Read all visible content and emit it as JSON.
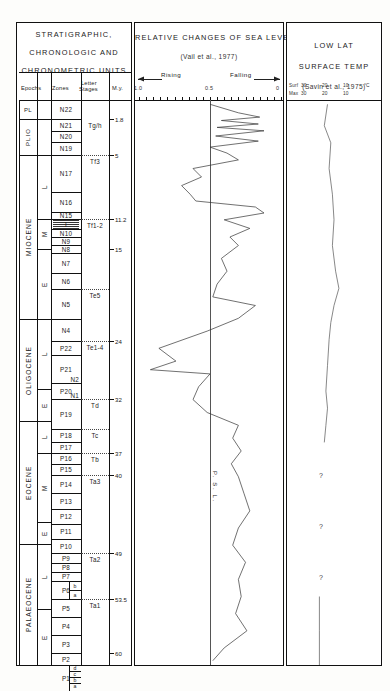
{
  "panels": {
    "strat": {
      "title_lines": [
        "STRATIGRAPHIC,",
        "CHRONOLOGIC  AND",
        "CHRONOMETRIC   UNITS"
      ],
      "column_headers": [
        "Epochs",
        "Zones",
        "Letter",
        "Stages",
        "M.y."
      ]
    },
    "sea": {
      "title": "RELATIVE CHANGES OF SEA LEVEL",
      "source": "(Vail et al., 1977)",
      "rising_label": "Rising",
      "falling_label": "Falling",
      "scale_ticks": [
        "1.0",
        "0.5",
        "0"
      ],
      "curve_label": "P. S. L."
    },
    "temp": {
      "title_lines": [
        "LOW  LAT",
        "SURFACE  TEMP"
      ],
      "source": "(Savin et al., 1975)",
      "scale_rows": [
        {
          "name": "Surf",
          "ticks": [
            "30",
            "20",
            "10",
            "°C"
          ]
        },
        {
          "name": "Max",
          "ticks": [
            "30",
            "20",
            "10"
          ]
        }
      ],
      "uncertain_marks": [
        "?",
        "?",
        "?"
      ]
    }
  },
  "epochs": [
    {
      "label": "PL",
      "top": 99,
      "bottom": 118
    },
    {
      "label": "PLIO",
      "top": 118,
      "bottom": 154
    },
    {
      "label": "MIOCENE",
      "top": 154,
      "bottom": 318
    },
    {
      "label": "OLIGOCENE",
      "top": 318,
      "bottom": 420
    },
    {
      "label": "EOCENE",
      "top": 420,
      "bottom": 543
    },
    {
      "label": "PALAEOCENE",
      "top": 543,
      "bottom": 664
    }
  ],
  "subepochs": [
    {
      "label": "L",
      "top": 154,
      "bottom": 218
    },
    {
      "label": "M",
      "top": 218,
      "bottom": 248
    },
    {
      "label": "E",
      "top": 248,
      "bottom": 318
    },
    {
      "label": "L",
      "top": 318,
      "bottom": 388
    },
    {
      "label": "E",
      "top": 388,
      "bottom": 420
    },
    {
      "label": "L",
      "top": 420,
      "bottom": 452
    },
    {
      "label": "M",
      "top": 452,
      "bottom": 521
    },
    {
      "label": "E",
      "top": 521,
      "bottom": 543
    },
    {
      "label": "L",
      "top": 543,
      "bottom": 608
    },
    {
      "label": "E",
      "top": 608,
      "bottom": 664
    }
  ],
  "zones": [
    {
      "label": "N22",
      "top": 99,
      "bottom": 118
    },
    {
      "label": "N21",
      "top": 118,
      "bottom": 130
    },
    {
      "label": "N20",
      "top": 130,
      "bottom": 141
    },
    {
      "label": "N19",
      "top": 141,
      "bottom": 154
    },
    {
      "label": "N17",
      "top": 154,
      "bottom": 191
    },
    {
      "label": "N16",
      "top": 191,
      "bottom": 211
    },
    {
      "label": "N15",
      "top": 211,
      "bottom": 218
    },
    {
      "label": "I",
      "top": 218,
      "bottom": 228
    },
    {
      "label": "N10",
      "top": 228,
      "bottom": 236
    },
    {
      "label": "N9",
      "top": 236,
      "bottom": 244
    },
    {
      "label": "N8",
      "top": 244,
      "bottom": 252
    },
    {
      "label": "N7",
      "top": 252,
      "bottom": 272
    },
    {
      "label": "N6",
      "top": 272,
      "bottom": 288
    },
    {
      "label": "N5",
      "top": 288,
      "bottom": 318
    },
    {
      "label": "N4",
      "top": 318,
      "bottom": 340
    },
    {
      "label": "P22",
      "top": 340,
      "bottom": 354
    },
    {
      "label": "P21",
      "top": 354,
      "bottom": 382
    },
    {
      "label": "N2",
      "top": 375,
      "bottom": 382
    },
    {
      "label": "P20",
      "top": 382,
      "bottom": 398
    },
    {
      "label": "N1",
      "top": 392,
      "bottom": 398
    },
    {
      "label": "P19",
      "top": 398,
      "bottom": 428
    },
    {
      "label": "P18",
      "top": 428,
      "bottom": 441
    },
    {
      "label": "P17",
      "top": 441,
      "bottom": 452
    },
    {
      "label": "P16",
      "top": 452,
      "bottom": 463
    },
    {
      "label": "P15",
      "top": 463,
      "bottom": 474
    },
    {
      "label": "P14",
      "top": 474,
      "bottom": 492
    },
    {
      "label": "P13",
      "top": 492,
      "bottom": 508
    },
    {
      "label": "P12",
      "top": 508,
      "bottom": 523
    },
    {
      "label": "P11",
      "top": 523,
      "bottom": 538
    },
    {
      "label": "P10",
      "top": 538,
      "bottom": 552
    },
    {
      "label": "P9",
      "top": 552,
      "bottom": 562
    },
    {
      "label": "P8",
      "top": 562,
      "bottom": 571
    },
    {
      "label": "P7",
      "top": 571,
      "bottom": 580
    },
    {
      "label": "P6",
      "top": 580,
      "bottom": 598
    },
    {
      "label": "P5",
      "top": 598,
      "bottom": 616
    },
    {
      "label": "P4",
      "top": 616,
      "bottom": 634
    },
    {
      "label": "P3",
      "top": 634,
      "bottom": 652
    },
    {
      "label": "P2",
      "top": 652,
      "bottom": 664
    },
    {
      "label": "P1",
      "top": 664,
      "bottom": 690
    }
  ],
  "subzones": [
    {
      "label": "b",
      "top": 580,
      "bottom": 589
    },
    {
      "label": "a",
      "top": 589,
      "bottom": 598
    },
    {
      "label": "d",
      "top": 664,
      "bottom": 670
    },
    {
      "label": "c",
      "top": 670,
      "bottom": 676
    },
    {
      "label": "b",
      "top": 676,
      "bottom": 682
    },
    {
      "label": "a",
      "top": 682,
      "bottom": 688
    }
  ],
  "letter_stages": [
    {
      "label": "Tg/h",
      "top": 118,
      "bottom": 154
    },
    {
      "label": "Tf3",
      "top": 154,
      "bottom": 218
    },
    {
      "label": "Tf1-2",
      "top": 218,
      "bottom": 288
    },
    {
      "label": "Te5",
      "top": 288,
      "bottom": 340
    },
    {
      "label": "Te1-4",
      "top": 340,
      "bottom": 398
    },
    {
      "label": "Td",
      "top": 398,
      "bottom": 428
    },
    {
      "label": "Tc",
      "top": 428,
      "bottom": 452
    },
    {
      "label": "Tb",
      "top": 452,
      "bottom": 474
    },
    {
      "label": "Ta3",
      "top": 474,
      "bottom": 552
    },
    {
      "label": "Ta2",
      "top": 552,
      "bottom": 598
    },
    {
      "label": "Ta1",
      "top": 598,
      "bottom": 690
    }
  ],
  "my_scale": [
    {
      "value": "1.8",
      "y": 118
    },
    {
      "value": "5",
      "y": 154
    },
    {
      "value": "11.2",
      "y": 218
    },
    {
      "value": "15",
      "y": 248
    },
    {
      "value": "24",
      "y": 340
    },
    {
      "value": "32",
      "y": 398
    },
    {
      "value": "37",
      "y": 452
    },
    {
      "value": "40",
      "y": 474
    },
    {
      "value": "49",
      "y": 552
    },
    {
      "value": "53.5",
      "y": 598
    },
    {
      "value": "60",
      "y": 652
    }
  ],
  "chart_data": {
    "type": "line",
    "charts": [
      {
        "name": "sea_level",
        "type": "line",
        "title": "RELATIVE CHANGES OF SEA LEVEL",
        "source": "(Vail et al., 1977)",
        "xlabel": "Relative sea level (Rising ← / → Falling)",
        "ylabel": "Age (M.y.)",
        "xlim": [
          1.0,
          0.0
        ],
        "ylim": [
          0,
          66
        ],
        "xticks": [
          1.0,
          0.5,
          0.0
        ],
        "reference_line": {
          "x": 0.5,
          "label": "P. S. L."
        },
        "grid": false,
        "points": [
          {
            "age": 0.5,
            "x": 0.5
          },
          {
            "age": 1.5,
            "x": 0.3
          },
          {
            "age": 2.0,
            "x": 0.15
          },
          {
            "age": 2.4,
            "x": 0.42
          },
          {
            "age": 2.8,
            "x": 0.16
          },
          {
            "age": 3.2,
            "x": 0.45
          },
          {
            "age": 3.6,
            "x": 0.12
          },
          {
            "age": 4.2,
            "x": 0.46
          },
          {
            "age": 4.8,
            "x": 0.16
          },
          {
            "age": 5.5,
            "x": 0.5
          },
          {
            "age": 6.2,
            "x": 0.38
          },
          {
            "age": 7.0,
            "x": 0.3
          },
          {
            "age": 8.0,
            "x": 0.62
          },
          {
            "age": 9.0,
            "x": 0.56
          },
          {
            "age": 10.0,
            "x": 0.7
          },
          {
            "age": 11.0,
            "x": 0.64
          },
          {
            "age": 11.8,
            "x": 0.6
          },
          {
            "age": 12.5,
            "x": 0.18
          },
          {
            "age": 13.2,
            "x": 0.12
          },
          {
            "age": 14.0,
            "x": 0.4
          },
          {
            "age": 15.0,
            "x": 0.22
          },
          {
            "age": 16.0,
            "x": 0.36
          },
          {
            "age": 17.0,
            "x": 0.3
          },
          {
            "age": 18.5,
            "x": 0.42
          },
          {
            "age": 20.0,
            "x": 0.38
          },
          {
            "age": 21.5,
            "x": 0.45
          },
          {
            "age": 23.0,
            "x": 0.48
          },
          {
            "age": 24.0,
            "x": 0.18
          },
          {
            "age": 25.5,
            "x": 0.3
          },
          {
            "age": 27.0,
            "x": 0.52
          },
          {
            "age": 29.0,
            "x": 0.86
          },
          {
            "age": 30.5,
            "x": 0.74
          },
          {
            "age": 31.5,
            "x": 0.92
          },
          {
            "age": 32.0,
            "x": 0.5
          },
          {
            "age": 33.5,
            "x": 0.58
          },
          {
            "age": 35.0,
            "x": 0.62
          },
          {
            "age": 36.5,
            "x": 0.52
          },
          {
            "age": 38.0,
            "x": 0.3
          },
          {
            "age": 39.5,
            "x": 0.34
          },
          {
            "age": 41.0,
            "x": 0.28
          },
          {
            "age": 42.5,
            "x": 0.35
          },
          {
            "age": 44.0,
            "x": 0.3
          },
          {
            "age": 46.0,
            "x": 0.26
          },
          {
            "age": 48.0,
            "x": 0.22
          },
          {
            "age": 50.0,
            "x": 0.3
          },
          {
            "age": 52.0,
            "x": 0.34
          },
          {
            "age": 54.0,
            "x": 0.25
          },
          {
            "age": 56.0,
            "x": 0.3
          },
          {
            "age": 58.0,
            "x": 0.28
          },
          {
            "age": 60.0,
            "x": 0.32
          },
          {
            "age": 62.0,
            "x": 0.24
          },
          {
            "age": 64.0,
            "x": 0.4
          },
          {
            "age": 65.5,
            "x": 0.48
          }
        ]
      },
      {
        "name": "low_lat_surface_temp",
        "type": "line",
        "title": "LOW LAT SURFACE TEMP",
        "source": "(Savin et al., 1975)",
        "xlabel": "Temperature (°C)",
        "ylabel": "Age (M.y.)",
        "xticks": [
          30,
          20,
          10
        ],
        "xlim": [
          32,
          8
        ],
        "ylim": [
          0,
          66
        ],
        "grid": false,
        "uncertain_intervals": [
          {
            "age_from": 40,
            "age_to": 58,
            "marker": "?"
          }
        ],
        "points": [
          {
            "age": 0.5,
            "t": 22
          },
          {
            "age": 3,
            "t": 23
          },
          {
            "age": 5,
            "t": 21
          },
          {
            "age": 8,
            "t": 21.5
          },
          {
            "age": 11,
            "t": 20.5
          },
          {
            "age": 14,
            "t": 20
          },
          {
            "age": 17,
            "t": 20.5
          },
          {
            "age": 20,
            "t": 19.5
          },
          {
            "age": 22,
            "t": 18.5
          },
          {
            "age": 24,
            "t": 20
          },
          {
            "age": 26,
            "t": 21
          },
          {
            "age": 28,
            "t": 21.5
          },
          {
            "age": 31,
            "t": 22
          },
          {
            "age": 34,
            "t": 22.5
          },
          {
            "age": 36,
            "t": 22
          },
          {
            "age": 38,
            "t": 22.5
          },
          {
            "age": 40,
            "t": 23
          },
          {
            "age": 42,
            "t": 24
          },
          {
            "age": 45,
            "t": 24.5
          },
          {
            "age": 48,
            "t": 24
          },
          {
            "age": 50,
            "t": 24.5
          },
          {
            "age": 52,
            "t": 24.5
          },
          {
            "age": 58,
            "t": 24.5
          },
          {
            "age": 62,
            "t": 24.5
          },
          {
            "age": 66,
            "t": 24.5
          }
        ]
      }
    ]
  }
}
